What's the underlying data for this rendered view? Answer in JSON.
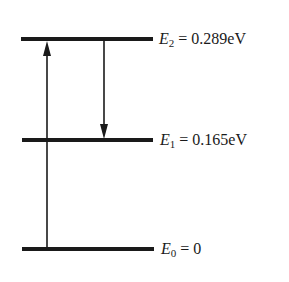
{
  "levels": [
    {
      "symbol": "E",
      "index": "2",
      "eq": " = ",
      "value": "0.289eV",
      "y": 39
    },
    {
      "symbol": "E",
      "index": "1",
      "eq": " = ",
      "value": "0.165eV",
      "y": 140
    },
    {
      "symbol": "E",
      "index": "0",
      "eq": " = ",
      "value": "0",
      "y": 249
    }
  ],
  "arrows": [
    {
      "name": "absorption-arrow",
      "direction": "up",
      "from": "E0",
      "to": "E2"
    },
    {
      "name": "emission-arrow",
      "direction": "down",
      "from": "E2",
      "to": "E1"
    }
  ]
}
